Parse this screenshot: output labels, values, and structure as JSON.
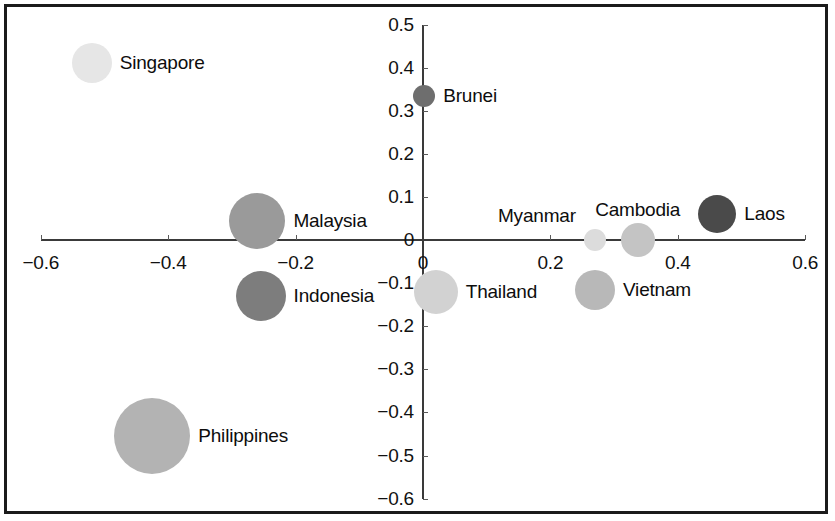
{
  "chart_data": {
    "type": "scatter",
    "title": "",
    "subtitle": "",
    "xlabel": "",
    "ylabel": "",
    "xlim": [
      -0.6,
      0.6
    ],
    "ylim": [
      -0.6,
      0.5
    ],
    "grid": false,
    "legend": "none",
    "bubble_size_meaning": "bubble area",
    "xticks": [
      {
        "value": -0.6,
        "label": "−0.6"
      },
      {
        "value": -0.4,
        "label": "−0.4"
      },
      {
        "value": -0.2,
        "label": "−0.2"
      },
      {
        "value": 0.0,
        "label": "0"
      },
      {
        "value": 0.2,
        "label": "0.2"
      },
      {
        "value": 0.4,
        "label": "0.4"
      },
      {
        "value": 0.6,
        "label": "0.6"
      }
    ],
    "yticks": [
      {
        "value": 0.5,
        "label": "0.5"
      },
      {
        "value": 0.4,
        "label": "0.4"
      },
      {
        "value": 0.3,
        "label": "0.3"
      },
      {
        "value": 0.2,
        "label": "0.2"
      },
      {
        "value": 0.1,
        "label": "0.1"
      },
      {
        "value": 0.0,
        "label": "0"
      },
      {
        "value": -0.1,
        "label": "−0.1"
      },
      {
        "value": -0.2,
        "label": "−0.2"
      },
      {
        "value": -0.3,
        "label": "−0.3"
      },
      {
        "value": -0.4,
        "label": "−0.4"
      },
      {
        "value": -0.5,
        "label": "−0.5"
      },
      {
        "value": -0.6,
        "label": "−0.6"
      }
    ],
    "points": [
      {
        "label": "Singapore",
        "x": -0.52,
        "y": 0.41,
        "r": 20,
        "color": "#e6e6e6",
        "label_pos": "right"
      },
      {
        "label": "Malaysia",
        "x": -0.26,
        "y": 0.045,
        "r": 28,
        "color": "#9a9a9a",
        "label_pos": "right"
      },
      {
        "label": "Indonesia",
        "x": -0.255,
        "y": -0.13,
        "r": 25,
        "color": "#7d7d7d",
        "label_pos": "right"
      },
      {
        "label": "Philippines",
        "x": -0.425,
        "y": -0.455,
        "r": 38,
        "color": "#b3b3b3",
        "label_pos": "right"
      },
      {
        "label": "Brunei",
        "x": 0.002,
        "y": 0.335,
        "r": 11,
        "color": "#6e6e6e",
        "label_pos": "right"
      },
      {
        "label": "Thailand",
        "x": 0.02,
        "y": -0.12,
        "r": 22,
        "color": "#d2d2d2",
        "label_pos": "right"
      },
      {
        "label": "Myanmar",
        "x": 0.27,
        "y": 0.0,
        "r": 11,
        "color": "#dcdcdc",
        "label_pos": "above-left"
      },
      {
        "label": "Vietnam",
        "x": 0.27,
        "y": -0.115,
        "r": 20,
        "color": "#b8b8b8",
        "label_pos": "right"
      },
      {
        "label": "Cambodia",
        "x": 0.337,
        "y": 0.0,
        "r": 17,
        "color": "#c4c4c4",
        "label_pos": "above"
      },
      {
        "label": "Laos",
        "x": 0.462,
        "y": 0.06,
        "r": 19,
        "color": "#4a4a4a",
        "label_pos": "right"
      }
    ]
  },
  "colors": {
    "frame": "#1b1b1b",
    "axis": "#3a3a3a",
    "text": "#0d0d0d",
    "background": "#ffffff"
  }
}
